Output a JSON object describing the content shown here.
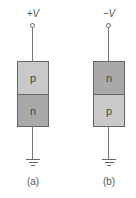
{
  "figure": {
    "panels": [
      {
        "supply_label": "+V",
        "top_region": "p",
        "bottom_region": "n",
        "caption": "(a)"
      },
      {
        "supply_label": "−V",
        "top_region": "n",
        "bottom_region": "p",
        "caption": "(b)"
      }
    ],
    "colors": {
      "p_region": "#c9c9c9",
      "n_region": "#a9a9a9",
      "outline": "#666666"
    }
  }
}
